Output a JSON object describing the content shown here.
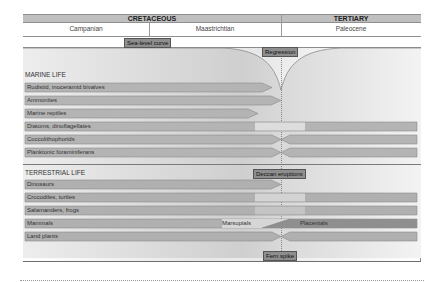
{
  "header": {
    "periods": [
      {
        "label": "CRETACEOUS"
      },
      {
        "label": "TERTIARY"
      }
    ],
    "stages": [
      {
        "label": "Campanian"
      },
      {
        "label": "Maastrichtian"
      },
      {
        "label": "Paleocene"
      }
    ]
  },
  "annotations": {
    "sea_level_curve": "Sea-level curve",
    "regression": "Regression",
    "deccan_eruptions": "Deccan eruptions",
    "fern_spike": "Fern spike"
  },
  "marine": {
    "title": "MARINE LIFE",
    "rows": [
      {
        "label": "Rudistid, inoceramid bivalves",
        "fate": "extinct-before-boundary"
      },
      {
        "label": "Ammonites",
        "fate": "extinct-at-boundary"
      },
      {
        "label": "Marine reptiles",
        "fate": "extinct-before-boundary"
      },
      {
        "label": "Diatoms, dinoflagellates",
        "fate": "survived"
      },
      {
        "label": "Coccolithophorids",
        "fate": "bottleneck"
      },
      {
        "label": "Planktonic foraminiferans",
        "fate": "bottleneck"
      }
    ]
  },
  "terrestrial": {
    "title": "TERRESTRIAL LIFE",
    "rows": [
      {
        "label": "Dinosaurs",
        "fate": "extinct-at-boundary"
      },
      {
        "label": "Crocodiles, turtles",
        "fate": "survived"
      },
      {
        "label": "Salamanders, frogs",
        "fate": "survived"
      },
      {
        "label": "Mammals",
        "fate": "transition",
        "left_label": "Marsupials",
        "right_label": "Placentals"
      },
      {
        "label": "Land plants",
        "fate": "bottleneck"
      }
    ]
  },
  "colors": {
    "bar_fill": "#b4b4b4",
    "bar_dark": "#9a9a9a",
    "tag_fill": "#8e8e8e",
    "header_fill": "#bfbfbf"
  }
}
